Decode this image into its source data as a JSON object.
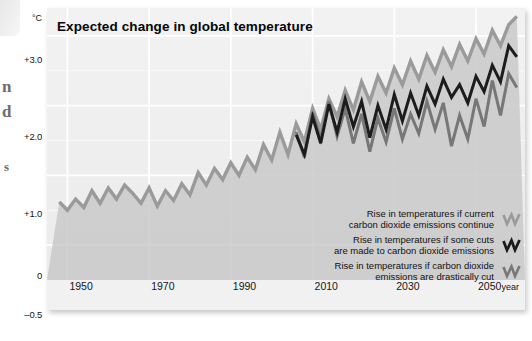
{
  "page_margin": {
    "fragments": [
      "n",
      "d",
      "s"
    ]
  },
  "chart": {
    "title": "Expected change in global temperature",
    "y_unit": "°C",
    "x_unit": "year",
    "y_ticks": [
      "+3.0",
      "+2.0",
      "+1.0",
      "0",
      "–0.5"
    ],
    "x_ticks": [
      "1950",
      "1970",
      "1990",
      "2010",
      "2030",
      "2050"
    ],
    "legend": [
      {
        "line1": "Rise in temperatures if current",
        "line2": "carbon dioxide emissions continue",
        "swatch": "zigzag-icon-light",
        "color": "#9a9a9a"
      },
      {
        "line1": "Rise in temperatures if some cuts",
        "line2": "are made to carbon dioxide emissions",
        "swatch": "zigzag-icon-dark",
        "color": "#1c1c1c"
      },
      {
        "line1": "Rise in temperatures if carbon dioxide",
        "line2": "emissions are drastically cut",
        "swatch": "zigzag-icon-mid",
        "color": "#777777"
      }
    ]
  },
  "chart_data": {
    "type": "line",
    "title": "Expected change in global temperature",
    "xlabel": "year",
    "ylabel": "°C",
    "xlim": [
      1945,
      2062
    ],
    "ylim": [
      -0.5,
      3.4
    ],
    "grid": true,
    "legend_position": "bottom-right",
    "colors": {
      "high": "#9a9a9a",
      "medium": "#1c1c1c",
      "low": "#777777",
      "fill": "#c9c9c9"
    },
    "series": [
      {
        "name": "Rise in temperatures if current carbon dioxide emissions continue",
        "color": "#9a9a9a",
        "x": [
          1948,
          1950,
          1952,
          1954,
          1956,
          1958,
          1960,
          1962,
          1964,
          1966,
          1968,
          1970,
          1972,
          1974,
          1976,
          1978,
          1980,
          1982,
          1984,
          1986,
          1988,
          1990,
          1992,
          1994,
          1996,
          1998,
          2000,
          2002,
          2004,
          2006,
          2008,
          2010,
          2012,
          2014,
          2016,
          2018,
          2020,
          2022,
          2024,
          2026,
          2028,
          2030,
          2032,
          2034,
          2036,
          2038,
          2040,
          2042,
          2044,
          2046,
          2048,
          2050,
          2052,
          2054,
          2056,
          2058,
          2060
        ],
        "values": [
          0.62,
          0.5,
          0.66,
          0.54,
          0.78,
          0.6,
          0.82,
          0.66,
          0.86,
          0.74,
          0.6,
          0.82,
          0.56,
          0.78,
          0.64,
          0.88,
          0.72,
          1.04,
          0.86,
          1.1,
          0.94,
          1.18,
          1.0,
          1.26,
          1.08,
          1.44,
          1.22,
          1.62,
          1.3,
          1.74,
          1.48,
          1.96,
          1.66,
          2.1,
          1.84,
          2.22,
          1.94,
          2.34,
          2.06,
          2.42,
          2.18,
          2.54,
          2.3,
          2.64,
          2.38,
          2.72,
          2.48,
          2.8,
          2.56,
          2.88,
          2.64,
          2.96,
          2.74,
          3.08,
          2.86,
          3.16,
          3.28
        ]
      },
      {
        "name": "Rise in temperatures if some cuts are made to carbon dioxide emissions",
        "color": "#1c1c1c",
        "x": [
          2006,
          2008,
          2010,
          2012,
          2014,
          2016,
          2018,
          2020,
          2022,
          2024,
          2026,
          2028,
          2030,
          2032,
          2034,
          2036,
          2038,
          2040,
          2042,
          2044,
          2046,
          2048,
          2050,
          2052,
          2054,
          2056,
          2058,
          2060
        ],
        "values": [
          1.58,
          1.3,
          1.84,
          1.46,
          2.02,
          1.62,
          2.1,
          1.7,
          2.06,
          1.54,
          2.0,
          1.66,
          2.16,
          1.78,
          2.18,
          1.86,
          2.28,
          2.02,
          2.38,
          2.12,
          2.3,
          2.04,
          2.42,
          2.2,
          2.58,
          2.34,
          2.86,
          2.7
        ]
      },
      {
        "name": "Rise in temperatures if carbon dioxide emissions are drastically cut",
        "color": "#777777",
        "x": [
          2006,
          2008,
          2010,
          2012,
          2014,
          2016,
          2018,
          2020,
          2022,
          2024,
          2026,
          2028,
          2030,
          2032,
          2034,
          2036,
          2038,
          2040,
          2042,
          2044,
          2046,
          2048,
          2050,
          2052,
          2054,
          2056,
          2058,
          2060
        ],
        "values": [
          1.62,
          1.26,
          1.9,
          1.52,
          2.06,
          1.56,
          1.96,
          1.46,
          1.88,
          1.34,
          1.82,
          1.48,
          1.96,
          1.52,
          1.88,
          1.6,
          2.06,
          1.66,
          2.04,
          1.42,
          1.86,
          1.52,
          2.1,
          1.7,
          2.36,
          1.86,
          2.46,
          2.26
        ]
      }
    ]
  }
}
